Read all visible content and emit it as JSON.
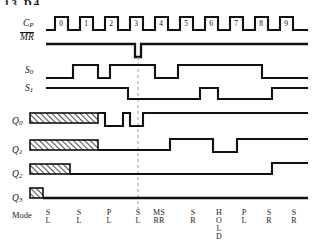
{
  "figure": {
    "type": "digital-timing-diagram",
    "title_fragment": "13  D4",
    "reference_marker_x": 138
  },
  "signals": {
    "clock": {
      "name": "C_P",
      "label_base": "C",
      "label_sub": "P",
      "pulse_labels": [
        "0",
        "1",
        "2",
        "3",
        "4",
        "5",
        "6",
        "7",
        "8",
        "9"
      ]
    },
    "master_reset": {
      "name": "MR",
      "label": "MR",
      "overbar": true,
      "idle_level": "high",
      "pulse": "active-low-glitch"
    },
    "s0": {
      "name": "S0",
      "label_base": "S",
      "label_sub": "0"
    },
    "s1": {
      "name": "S1",
      "label_base": "S",
      "label_sub": "1"
    },
    "q0": {
      "name": "Q0",
      "label_base": "Q",
      "label_sub": "0",
      "has_undefined_region": true
    },
    "q1": {
      "name": "Q1",
      "label_base": "Q",
      "label_sub": "1",
      "has_undefined_region": true
    },
    "q2": {
      "name": "Q2",
      "label_base": "Q",
      "label_sub": "2",
      "has_undefined_region": true
    },
    "q3": {
      "name": "Q3",
      "label_base": "Q",
      "label_sub": "3",
      "has_undefined_region": true
    }
  },
  "mode_row": {
    "label": "Mode",
    "entries": [
      {
        "lines": [
          "S",
          "L"
        ],
        "x": 37
      },
      {
        "lines": [
          "S",
          "L"
        ],
        "x": 68
      },
      {
        "lines": [
          "P",
          "L"
        ],
        "x": 98
      },
      {
        "lines": [
          "S",
          "L"
        ],
        "x": 127
      },
      {
        "lines": [
          "MS",
          "RR"
        ],
        "x": 148
      },
      {
        "lines": [
          "S",
          "R"
        ],
        "x": 182
      },
      {
        "lines": [
          "H",
          "O",
          "L",
          "D"
        ],
        "x": 208
      },
      {
        "lines": [
          "P",
          "L"
        ],
        "x": 233
      },
      {
        "lines": [
          "S",
          "R"
        ],
        "x": 258
      },
      {
        "lines": [
          "S",
          "R"
        ],
        "x": 283
      }
    ]
  },
  "chart_data": {
    "type": "line",
    "x_axis": {
      "unit": "clock pulse",
      "ticks": [
        0,
        1,
        2,
        3,
        4,
        5,
        6,
        7,
        8,
        9
      ]
    },
    "traces": [
      {
        "name": "C_P",
        "kind": "clock",
        "pulses": 10,
        "start_x": 55,
        "period": 25,
        "high_width": 13
      },
      {
        "name": "MR",
        "kind": "level",
        "levels": "high except narrow low pulse at x=138"
      },
      {
        "name": "S0",
        "kind": "level",
        "edges_x": [
          73,
          98,
          110,
          140,
          155,
          178,
          205,
          290
        ]
      },
      {
        "name": "S1",
        "kind": "level",
        "edges_x": [
          128,
          200,
          218,
          290
        ]
      },
      {
        "name": "Q0",
        "kind": "level",
        "undefined_until_x": 80,
        "edges_x": [
          105,
          123,
          140
        ]
      },
      {
        "name": "Q1",
        "kind": "level",
        "undefined_until_x": 80,
        "edges_x": [
          170,
          213,
          237
        ]
      },
      {
        "name": "Q2",
        "kind": "level",
        "undefined_until_x": 58,
        "edges_x": [
          272
        ]
      },
      {
        "name": "Q3",
        "kind": "level",
        "undefined_until_x": 40,
        "edges_x": []
      }
    ],
    "legend": "none",
    "grid": false
  },
  "colors": {
    "ink": "#111111",
    "background": "#ffffff",
    "reference_line": "#b9909a",
    "hatch": "#111111"
  }
}
